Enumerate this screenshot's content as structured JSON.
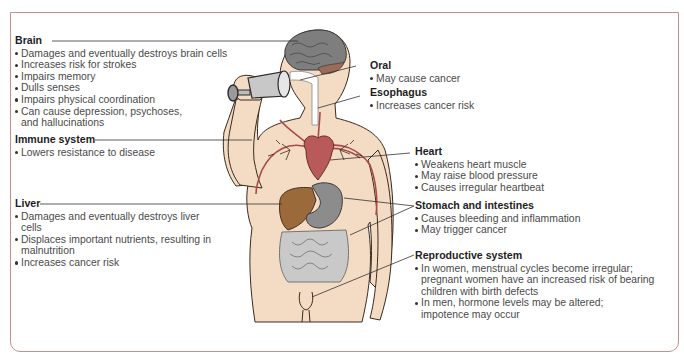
{
  "diagram": {
    "colors": {
      "frame": "#c98e8e",
      "skin": "#f3dcc3",
      "outline": "#3a2a20",
      "vessels": "#a84a4a",
      "brain": "#7a7a7a",
      "liver": "#9a6a3a",
      "stomach": "#8c8c8c",
      "leader_line": "#333333"
    },
    "callouts": [
      {
        "id": "brain",
        "title": "Brain",
        "items": [
          "Damages and eventually destroys brain cells",
          "Increases risk for strokes",
          "Impairs memory",
          "Dulls senses",
          "Impairs physical coordination",
          "Can cause depression, psychoses, and hallucinations"
        ]
      },
      {
        "id": "immune",
        "title": "Immune system",
        "items": [
          "Lowers resistance to disease"
        ]
      },
      {
        "id": "liver",
        "title": "Liver",
        "items": [
          "Damages and eventually destroys liver cells",
          "Displaces important nutrients, resulting in malnutrition",
          "Increases cancer risk"
        ]
      },
      {
        "id": "oral",
        "title": "Oral",
        "items": [
          "May cause cancer"
        ]
      },
      {
        "id": "esophagus",
        "title": "Esophagus",
        "items": [
          "Increases cancer risk"
        ]
      },
      {
        "id": "heart",
        "title": "Heart",
        "items": [
          "Weakens heart muscle",
          "May raise blood pressure",
          "Causes irregular heartbeat"
        ]
      },
      {
        "id": "stomach",
        "title": "Stomach and intestines",
        "items": [
          "Causes bleeding and inflammation",
          "May trigger cancer"
        ]
      },
      {
        "id": "reproductive",
        "title": "Reproductive system",
        "items": [
          "In women, menstrual cycles become irregular; pregnant women have an increased risk of bearing children with birth defects",
          "In men, hormone levels may be altered; impotence may occur"
        ]
      }
    ]
  }
}
